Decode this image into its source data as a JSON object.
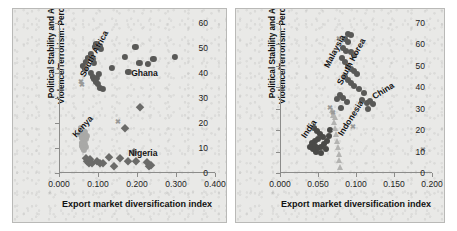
{
  "figure": {
    "type": "two-panel-scatter",
    "background_color": "#e9e9e7",
    "panel_border_color": "#b9b9b7"
  },
  "chart_data": [
    {
      "panel": "left",
      "type": "scatter",
      "title": "",
      "xlabel": "Export market diversification index",
      "ylabel": "Political Stability and Absence of Violence/Terrorism: Percentile Rank",
      "xlim": [
        0.0,
        0.4
      ],
      "ylim": [
        0,
        60
      ],
      "xticks": [
        "0.000",
        "0.100",
        "0.200",
        "0.300",
        "0.400"
      ],
      "xtick_values": [
        0.0,
        0.1,
        0.2,
        0.3,
        0.4
      ],
      "yticks": [
        "0",
        "10",
        "20",
        "30",
        "40",
        "50",
        "60"
      ],
      "ytick_values": [
        0,
        10,
        20,
        30,
        40,
        50,
        60
      ],
      "grid": false,
      "legend": "none (inline annotations)",
      "annotations": [
        {
          "label": "South Africa",
          "x": 0.06,
          "y": 41,
          "rotation": -62
        },
        {
          "label": "Ghana",
          "x": 0.185,
          "y": 42,
          "rotation": 0
        },
        {
          "label": "Kenya",
          "x": 0.038,
          "y": 17,
          "rotation": -48
        },
        {
          "label": "Nigeria",
          "x": 0.178,
          "y": 10,
          "rotation": 0
        }
      ],
      "series": [
        {
          "name": "South Africa",
          "marker": "circle",
          "color": "#595957",
          "size": 6.2,
          "points": [
            [
              0.062,
              43.0
            ],
            [
              0.066,
              41.5
            ],
            [
              0.07,
              44.5
            ],
            [
              0.074,
              46.0
            ],
            [
              0.082,
              47.5
            ],
            [
              0.086,
              45.5
            ],
            [
              0.09,
              44.0
            ],
            [
              0.092,
              50.5
            ],
            [
              0.096,
              51.5
            ],
            [
              0.1,
              50.5
            ],
            [
              0.104,
              51.0
            ],
            [
              0.108,
              49.5
            ],
            [
              0.082,
              40.0
            ],
            [
              0.086,
              38.5
            ],
            [
              0.09,
              37.5
            ],
            [
              0.094,
              36.5
            ],
            [
              0.098,
              38.0
            ],
            [
              0.102,
              39.5
            ],
            [
              0.1,
              35.5
            ],
            [
              0.104,
              34.0
            ],
            [
              0.112,
              33.5
            ],
            [
              0.136,
              42.0
            ],
            [
              0.168,
              46.5
            ],
            [
              0.178,
              40.5
            ],
            [
              0.196,
              50.5
            ],
            [
              0.206,
              44.0
            ],
            [
              0.228,
              43.5
            ],
            [
              0.242,
              45.5
            ],
            [
              0.298,
              46.5
            ]
          ]
        },
        {
          "name": "Kenya",
          "marker": "circle",
          "color": "#a9a9a7",
          "size": 6.2,
          "points": [
            [
              0.056,
              18.0
            ],
            [
              0.06,
              17.0
            ],
            [
              0.062,
              15.5
            ],
            [
              0.066,
              16.5
            ],
            [
              0.068,
              14.5
            ],
            [
              0.064,
              13.0
            ],
            [
              0.06,
              12.0
            ],
            [
              0.058,
              11.0
            ],
            [
              0.062,
              10.0
            ],
            [
              0.066,
              11.5
            ],
            [
              0.07,
              13.5
            ],
            [
              0.072,
              15.0
            ],
            [
              0.058,
              14.0
            ],
            [
              0.054,
              15.5
            ],
            [
              0.07,
              10.5
            ],
            [
              0.064,
              9.2
            ]
          ]
        },
        {
          "name": "Nigeria",
          "marker": "diamond",
          "color": "#6b6b69",
          "size": 5.6,
          "points": [
            [
              0.068,
              6.0
            ],
            [
              0.072,
              5.0
            ],
            [
              0.076,
              4.2
            ],
            [
              0.08,
              5.5
            ],
            [
              0.084,
              4.0
            ],
            [
              0.098,
              4.8
            ],
            [
              0.104,
              4.2
            ],
            [
              0.112,
              4.0
            ],
            [
              0.128,
              6.5
            ],
            [
              0.14,
              3.0
            ],
            [
              0.156,
              6.0
            ],
            [
              0.168,
              18.0
            ],
            [
              0.178,
              4.8
            ],
            [
              0.192,
              8.5
            ],
            [
              0.198,
              5.0
            ],
            [
              0.208,
              26.5
            ],
            [
              0.226,
              4.5
            ],
            [
              0.232,
              3.0
            ],
            [
              0.236,
              3.4
            ]
          ]
        },
        {
          "name": "other",
          "marker": "cross",
          "color": "#9a9a98",
          "size": 5.0,
          "points": [
            [
              0.056,
              37.0
            ],
            [
              0.059,
              35.8
            ],
            [
              0.15,
              21.0
            ]
          ]
        }
      ]
    },
    {
      "panel": "right",
      "type": "scatter",
      "title": "",
      "xlabel": "Export market diversification index",
      "ylabel": "Political Stability and Absence of Violence/Terrorism: Percentile Rank",
      "xlim": [
        0.0,
        0.2
      ],
      "ylim": [
        0,
        70
      ],
      "xticks": [
        "0.000",
        "0.050",
        "0.100",
        "0.150",
        "0.200"
      ],
      "xtick_values": [
        0.0,
        0.05,
        0.1,
        0.15,
        0.2
      ],
      "yticks": [
        "0",
        "10",
        "20",
        "30",
        "40",
        "50",
        "60",
        "70"
      ],
      "ytick_values": [
        0,
        10,
        20,
        30,
        40,
        50,
        60,
        70
      ],
      "grid": false,
      "legend": "none (inline annotations)",
      "annotations": [
        {
          "label": "Malaysia",
          "x": 0.06,
          "y": 52,
          "rotation": -62
        },
        {
          "label": "South Korea",
          "x": 0.078,
          "y": 44,
          "rotation": -62
        },
        {
          "label": "China",
          "x": 0.123,
          "y": 38,
          "rotation": -32
        },
        {
          "label": "India",
          "x": 0.03,
          "y": 19,
          "rotation": -55
        },
        {
          "label": "Indonesia",
          "x": 0.079,
          "y": 20,
          "rotation": -58
        }
      ],
      "series": [
        {
          "name": "Malaysia / South Korea",
          "marker": "circle",
          "color": "#595957",
          "size": 6.0,
          "points": [
            [
              0.089,
              65.0
            ],
            [
              0.093,
              64.5
            ],
            [
              0.086,
              62.5
            ],
            [
              0.09,
              61.0
            ],
            [
              0.083,
              58.5
            ],
            [
              0.087,
              57.0
            ],
            [
              0.094,
              56.5
            ],
            [
              0.098,
              55.0
            ],
            [
              0.081,
              53.5
            ],
            [
              0.085,
              52.0
            ],
            [
              0.09,
              50.0
            ],
            [
              0.094,
              48.5
            ],
            [
              0.098,
              47.5
            ],
            [
              0.101,
              46.0
            ],
            [
              0.086,
              45.0
            ],
            [
              0.09,
              43.5
            ],
            [
              0.094,
              42.0
            ],
            [
              0.098,
              40.5
            ],
            [
              0.104,
              39.0
            ],
            [
              0.11,
              37.5
            ],
            [
              0.079,
              36.5
            ],
            [
              0.083,
              35.0
            ],
            [
              0.075,
              34.5
            ],
            [
              0.088,
              33.0
            ],
            [
              0.108,
              34.0
            ],
            [
              0.114,
              32.5
            ],
            [
              0.118,
              33.5
            ],
            [
              0.122,
              32.0
            ],
            [
              0.116,
              30.0
            ],
            [
              0.08,
              30.5
            ]
          ]
        },
        {
          "name": "India",
          "marker": "circle",
          "color": "#4a4a48",
          "size": 6.0,
          "points": [
            [
              0.045,
              21.0
            ],
            [
              0.049,
              19.5
            ],
            [
              0.053,
              18.0
            ],
            [
              0.057,
              17.0
            ],
            [
              0.05,
              16.0
            ],
            [
              0.046,
              15.0
            ],
            [
              0.042,
              14.0
            ],
            [
              0.046,
              12.5
            ],
            [
              0.05,
              11.5
            ],
            [
              0.054,
              12.0
            ],
            [
              0.058,
              13.5
            ],
            [
              0.062,
              15.0
            ],
            [
              0.06,
              11.0
            ],
            [
              0.054,
              9.5
            ],
            [
              0.048,
              10.0
            ],
            [
              0.044,
              11.0
            ],
            [
              0.04,
              12.0
            ],
            [
              0.064,
              17.5
            ],
            [
              0.066,
              20.0
            ]
          ]
        },
        {
          "name": "Indonesia",
          "marker": "triangle",
          "color": "#b3b3b1",
          "size": 6.0,
          "points": [
            [
              0.071,
              24.0
            ],
            [
              0.073,
              21.0
            ],
            [
              0.074,
              18.0
            ],
            [
              0.075,
              15.0
            ],
            [
              0.076,
              12.0
            ],
            [
              0.077,
              9.0
            ],
            [
              0.078,
              6.0
            ],
            [
              0.079,
              3.0
            ],
            [
              0.07,
              27.0
            ],
            [
              0.069,
              29.5
            ],
            [
              0.072,
              26.0
            ]
          ]
        },
        {
          "name": "other",
          "marker": "cross",
          "color": "#9a9a98",
          "size": 5.0,
          "points": [
            [
              0.078,
              63.0
            ],
            [
              0.066,
              31.0
            ],
            [
              0.07,
              28.5
            ],
            [
              0.096,
              22.0
            ],
            [
              0.188,
              11.0
            ]
          ]
        }
      ]
    }
  ]
}
